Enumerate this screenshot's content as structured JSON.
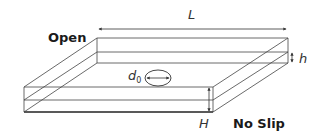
{
  "diagram": {
    "labels": {
      "length": "L",
      "film_thickness": "h",
      "substrate_height": "H",
      "hole_diameter_symbol": "d",
      "hole_diameter_subscript": "0",
      "top_boundary": "Open",
      "bottom_boundary": "No Slip"
    },
    "colors": {
      "line": "#333333",
      "text": "#1a1a1a",
      "background": "#ffffff"
    }
  }
}
